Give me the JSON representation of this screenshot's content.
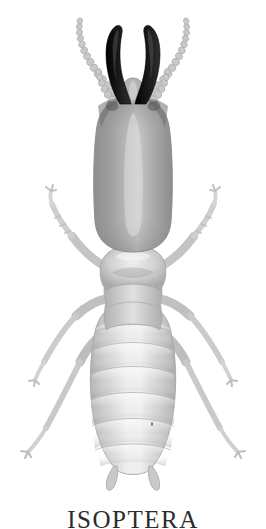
{
  "figure": {
    "alt_label": "termite-soldier-dorsal-view",
    "caption": "ISOPTERA",
    "background_color": "#ffffff"
  },
  "colors": {
    "background": "#ffffff",
    "mandible_dark": "#111111",
    "mandible_edge": "#3a3a3a",
    "head_mid": "#9a9a9a",
    "head_light": "#cfcfcf",
    "head_shadow": "#7f7f7f",
    "pronotum": "#c2c2c2",
    "thorax": "#cdcdcd",
    "abdomen_light": "#e4e4e4",
    "abdomen_mid": "#cacaca",
    "abdomen_shade": "#b4b4b4",
    "leg_light": "#d9d9d9",
    "leg_mid": "#bdbdbd",
    "antenna": "#c6c6c6",
    "outline": "#a8a8a8",
    "caption_text": "#2b2b2b"
  },
  "anatomy": {
    "mandibles": {
      "name": "mandibles",
      "count": 2,
      "color": "#111111",
      "description": "Long curved black sickle-shaped soldier mandibles crossing inward at the tips"
    },
    "antennae": {
      "name": "antennae",
      "count": 2,
      "bead_count": 14,
      "color": "#c6c6c6",
      "description": "Pale moniliform (beaded) antennae angled outward and upward"
    },
    "maxillary_palps": {
      "name": "maxillary-palps",
      "count": 2,
      "color": "#c6c6c6",
      "description": "Short segmented palps between antennae and mandibles"
    },
    "head_capsule": {
      "name": "head-capsule",
      "color": "#9a9a9a",
      "description": "Large elongate rectangular-oval darker gray head capsule"
    },
    "pronotum": {
      "name": "pronotum",
      "color": "#c2c2c2",
      "description": "Saddle-shaped pale pronotum behind the head"
    },
    "mesothorax": {
      "name": "mesothorax",
      "color": "#cdcdcd"
    },
    "metathorax": {
      "name": "metathorax",
      "color": "#cdcdcd"
    },
    "abdomen": {
      "name": "abdomen",
      "segment_count": 8,
      "color": "#dcdcdc",
      "description": "Broad pale segmented abdomen, widest at mid-length, tapering to rounded tip"
    },
    "cerci": {
      "name": "cerci",
      "count": 2,
      "color": "#c4c4c4",
      "description": "Short paired cerci at abdomen tip"
    },
    "legs": {
      "name": "legs",
      "count": 6,
      "color": "#cbcbcb",
      "description": "Three pairs of slender pale legs with femur, tibia and clawed tarsus"
    }
  },
  "legend": {
    "order_name": "ISOPTERA",
    "caste": "soldier"
  }
}
